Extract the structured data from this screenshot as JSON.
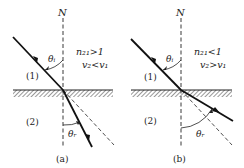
{
  "figure": {
    "panels": [
      {
        "id": "a",
        "caption": "(a)",
        "normal_label": "N",
        "condition_1": "n₂₁>1",
        "condition_2": "v₂<v₁",
        "medium_1": "(1)",
        "medium_2": "(2)",
        "angle_incident": "θᵢ",
        "angle_refracted": "θᵣ",
        "description": "Ray bends toward the normal when entering denser medium"
      },
      {
        "id": "b",
        "caption": "(b)",
        "normal_label": "N",
        "condition_1": "n₂₁<1",
        "condition_2": "v₂>v₁",
        "medium_1": "(1)",
        "medium_2": "(2)",
        "angle_incident": "θᵢ",
        "angle_refracted": "θᵣ",
        "description": "Ray bends away from the normal when entering rarer medium"
      }
    ],
    "colors": {
      "ink": "#222222",
      "background": "#ffffff"
    }
  }
}
